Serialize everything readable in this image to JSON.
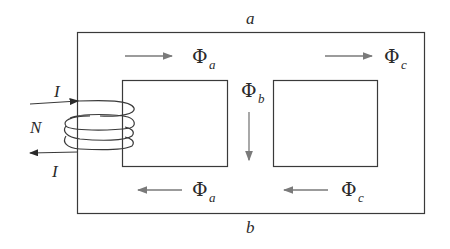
{
  "diagram": {
    "title_top": "a",
    "title_bottom": "b",
    "coil": {
      "turns_label": "N",
      "current_in": "I",
      "current_out": "I"
    },
    "fluxes": [
      {
        "id": "phi-a-top",
        "symbol": "Φ",
        "sub": "a",
        "direction": "right"
      },
      {
        "id": "phi-c-top",
        "symbol": "Φ",
        "sub": "c",
        "direction": "right"
      },
      {
        "id": "phi-b",
        "symbol": "Φ",
        "sub": "b",
        "direction": "down"
      },
      {
        "id": "phi-a-bottom",
        "symbol": "Φ",
        "sub": "a",
        "direction": "left"
      },
      {
        "id": "phi-c-bottom",
        "symbol": "Φ",
        "sub": "c",
        "direction": "left"
      }
    ],
    "colors": {
      "line": "#3a3a3a",
      "arrow": "#7a7a7a"
    }
  }
}
